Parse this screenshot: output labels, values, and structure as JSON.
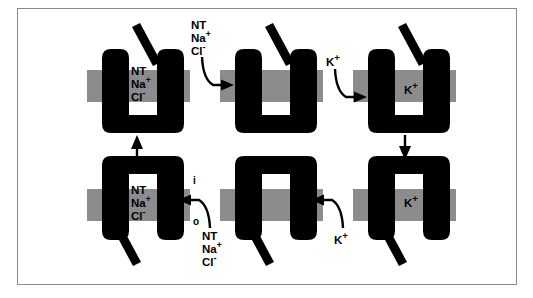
{
  "figure": {
    "type": "cycle-diagram",
    "border_color": "#8a8a8a",
    "background_color": "#ffffff",
    "protein_color": "#000000",
    "membrane_color": "#8c8c8c",
    "lumen_color": "#ffffff"
  },
  "ions": {
    "nt": "NT",
    "na": "Na",
    "na_charge": "+",
    "cl": "Cl",
    "cl_charge": "-",
    "k": "K",
    "k_charge": "+"
  },
  "membrane": {
    "inside_label": "i",
    "outside_label": "o"
  },
  "states": [
    {
      "id": "state-1",
      "name": "outward-open-loaded",
      "position": "top-left",
      "orientation": "up",
      "gate": "open",
      "cargo": [
        "NT",
        "Na+",
        "Cl-"
      ],
      "cargo_lines": [
        "NT",
        "Na",
        "Cl"
      ]
    },
    {
      "id": "state-2",
      "name": "outward-open-empty",
      "position": "top-center",
      "orientation": "up",
      "gate": "open",
      "cargo": [],
      "cargo_lines": []
    },
    {
      "id": "state-3",
      "name": "outward-open-potassium-bound",
      "position": "top-right",
      "orientation": "up",
      "gate": "open",
      "cargo": [
        "K+"
      ],
      "cargo_lines": [
        "K"
      ]
    },
    {
      "id": "state-4",
      "name": "inward-open-potassium-bound",
      "position": "bottom-right",
      "orientation": "down",
      "gate": "open",
      "cargo": [
        "K+"
      ],
      "cargo_lines": [
        "K"
      ]
    },
    {
      "id": "state-5",
      "name": "inward-open-empty",
      "position": "bottom-center",
      "orientation": "down",
      "gate": "open",
      "cargo": [],
      "cargo_lines": []
    },
    {
      "id": "state-6",
      "name": "inward-open-loaded",
      "position": "bottom-left",
      "orientation": "down",
      "gate": "open",
      "cargo": [
        "NT",
        "Na+",
        "Cl-"
      ],
      "cargo_lines": [
        "NT",
        "Na",
        "Cl"
      ]
    }
  ],
  "transitions": [
    {
      "id": "transition-1",
      "name": "release-neurotransmitter-sodium-chloride",
      "from": "state-1",
      "to": "state-2",
      "direction": "right",
      "label_lines": [
        "NT",
        "Na",
        "Cl"
      ],
      "label_kind": "nt-na-cl",
      "arrow_style": "curved-hook-right"
    },
    {
      "id": "transition-2",
      "name": "bind-potassium",
      "from": "state-2",
      "to": "state-3",
      "direction": "right",
      "label_lines": [
        "K"
      ],
      "label_kind": "k",
      "arrow_style": "curved-hook-right"
    },
    {
      "id": "transition-3",
      "name": "reorient-inward",
      "from": "state-3",
      "to": "state-4",
      "direction": "down",
      "label_lines": [],
      "label_kind": "none",
      "arrow_style": "straight-down"
    },
    {
      "id": "transition-4",
      "name": "release-potassium",
      "from": "state-4",
      "to": "state-5",
      "direction": "left",
      "label_lines": [
        "K"
      ],
      "label_kind": "k",
      "arrow_style": "curved-hook-left"
    },
    {
      "id": "transition-5",
      "name": "bind-neurotransmitter-sodium-chloride",
      "from": "state-5",
      "to": "state-6",
      "direction": "left",
      "label_lines": [
        "NT",
        "Na",
        "Cl"
      ],
      "label_kind": "nt-na-cl",
      "arrow_style": "curved-hook-left"
    },
    {
      "id": "transition-6",
      "name": "reorient-outward",
      "from": "state-6",
      "to": "state-1",
      "direction": "up",
      "label_lines": [],
      "label_kind": "none",
      "arrow_style": "straight-up"
    }
  ]
}
